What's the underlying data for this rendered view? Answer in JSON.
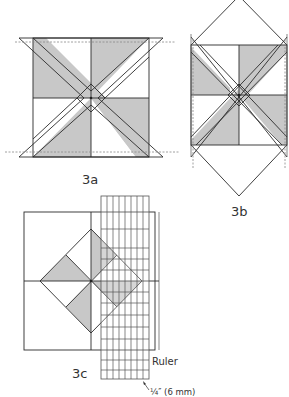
{
  "figures": [
    {
      "id": "3a",
      "label": "3a"
    },
    {
      "id": "3b",
      "label": "3b"
    },
    {
      "id": "3c",
      "label": "3c"
    }
  ],
  "annotations": {
    "ruler_label": "Ruler",
    "seam_allowance": "¼″ (6 mm)"
  },
  "colors": {
    "shade": "#c8c8c8",
    "line": "#2a2a2a",
    "dashed_line": "#888888",
    "text": "#333333"
  }
}
